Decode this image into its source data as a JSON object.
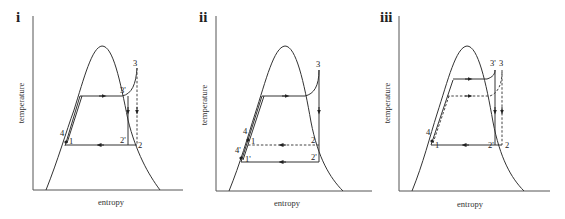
{
  "figure": {
    "type": "temperature-entropy diagrams",
    "panels": [
      {
        "id": "i",
        "panel_label": "i",
        "x_axis_label": "entropy",
        "y_axis_label": "temperature",
        "points": {
          "p1": "1",
          "p2": "2",
          "p2p": "2'",
          "p3": "3",
          "p3p": "3'",
          "p4": "4"
        }
      },
      {
        "id": "ii",
        "panel_label": "ii",
        "x_axis_label": "entropy",
        "y_axis_label": "temperature",
        "points": {
          "p1": "1",
          "p1p": "1'",
          "p2": "2",
          "p2p": "2'",
          "p3": "3",
          "p4": "4",
          "p4p": "4'"
        }
      },
      {
        "id": "iii",
        "panel_label": "iii",
        "x_axis_label": "entropy",
        "y_axis_label": "temperature",
        "points": {
          "p1": "1",
          "p2": "2",
          "p2p": "2'",
          "p3": "3",
          "p3p": "3'",
          "p4": "4"
        }
      }
    ],
    "colors": {
      "line": "#333333",
      "axis": "#555555",
      "background": "#ffffff"
    }
  }
}
